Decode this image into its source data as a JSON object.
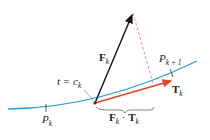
{
  "labels": {
    "force": {
      "main": "F",
      "sub": "k"
    },
    "tangent": {
      "main": "T",
      "sub": "k"
    },
    "t_eq": {
      "pre": "t = c",
      "sub": "k"
    },
    "p_k": {
      "main": "P",
      "sub": "k"
    },
    "p_k1": {
      "main": "P",
      "sub": "k + 1"
    },
    "dot": {
      "a": "F",
      "asub": "k",
      "op": " · ",
      "b": "T",
      "bsub": "k"
    }
  },
  "colors": {
    "curve": "#2a9fd8",
    "force_vector": "#111111",
    "tangent_vector": "#e0442a",
    "dashed": "#e07a6a",
    "brace": "#555555"
  }
}
